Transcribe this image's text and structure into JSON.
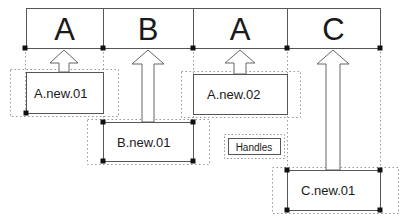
{
  "diagram": {
    "colors": {
      "solid_stroke": "#555555",
      "dashed_stroke": "#999999",
      "handle_dot": "#111111",
      "arrow_stroke": "#666666",
      "text": "#1a1a1a",
      "background": "#ffffff"
    },
    "top_row": {
      "name": "sequence-row",
      "cells": [
        {
          "label": "A",
          "x": 26,
          "w": 77
        },
        {
          "label": "B",
          "x": 103,
          "w": 90
        },
        {
          "label": "A",
          "x": 193,
          "w": 94
        },
        {
          "label": "C",
          "x": 287,
          "w": 93
        }
      ],
      "y": 8,
      "h": 40
    },
    "handles": {
      "legend_label": "Handles",
      "positions": [
        25,
        103,
        193,
        287,
        380
      ],
      "axis_y": 48
    },
    "nodes": [
      {
        "id": "a-new-01",
        "label": "A.new.01",
        "solid": {
          "x": 26,
          "y": 72,
          "w": 77,
          "h": 41
        },
        "dashed": {
          "x": 10,
          "y": 69,
          "w": 108,
          "h": 47
        },
        "text_x": 34,
        "text_y": 86,
        "dots": [
          {
            "x": 26,
            "y": 113
          }
        ]
      },
      {
        "id": "b-new-01",
        "label": "B.new.01",
        "solid": {
          "x": 103,
          "y": 122,
          "w": 90,
          "h": 39
        },
        "dashed": {
          "x": 87,
          "y": 119,
          "w": 122,
          "h": 45
        },
        "text_x": 117,
        "text_y": 135,
        "dots": [
          {
            "x": 103,
            "y": 122
          },
          {
            "x": 193,
            "y": 122
          },
          {
            "x": 103,
            "y": 161
          },
          {
            "x": 193,
            "y": 161
          }
        ]
      },
      {
        "id": "a-new-02",
        "label": "A.new.02",
        "solid": {
          "x": 193,
          "y": 74,
          "w": 94,
          "h": 40
        },
        "dashed": {
          "x": 181,
          "y": 71,
          "w": 119,
          "h": 46
        },
        "text_x": 207,
        "text_y": 87,
        "dots": []
      },
      {
        "id": "c-new-01",
        "label": "C.new.01",
        "solid": {
          "x": 287,
          "y": 170,
          "w": 93,
          "h": 40
        },
        "dashed": {
          "x": 272,
          "y": 167,
          "w": 126,
          "h": 46
        },
        "text_x": 301,
        "text_y": 183,
        "dots": [
          {
            "x": 287,
            "y": 170
          },
          {
            "x": 380,
            "y": 170
          },
          {
            "x": 287,
            "y": 210
          },
          {
            "x": 380,
            "y": 210
          }
        ]
      }
    ],
    "arrows": [
      {
        "id": "arrow-a-01",
        "cx": 64,
        "tip_y": 50,
        "tail_y": 72,
        "half_shaft": 5,
        "half_head": 14,
        "head_h": 13
      },
      {
        "id": "arrow-b-01",
        "cx": 148,
        "tip_y": 50,
        "tail_y": 122,
        "half_shaft": 6,
        "half_head": 16,
        "head_h": 14
      },
      {
        "id": "arrow-a-02",
        "cx": 240,
        "tip_y": 50,
        "tail_y": 74,
        "half_shaft": 6,
        "half_head": 15,
        "head_h": 13
      },
      {
        "id": "arrow-c-01",
        "cx": 333,
        "tip_y": 50,
        "tail_y": 170,
        "half_shaft": 7,
        "half_head": 16,
        "head_h": 14
      }
    ],
    "handles_legend": {
      "x": 224,
      "y": 134,
      "w": 60,
      "h": 24
    }
  }
}
